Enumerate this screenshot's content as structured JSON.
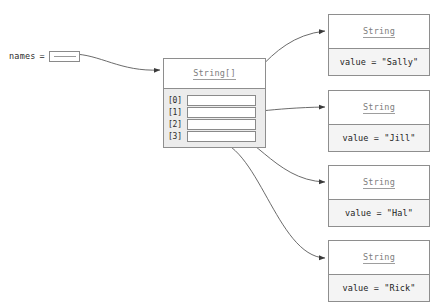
{
  "diagram": {
    "kind": "object-reference-diagram",
    "variable": {
      "name": "names",
      "assign": "=",
      "pointer_icon": "reference-pointer-icon"
    },
    "array_object": {
      "type_label": "String[]",
      "slots": [
        {
          "index_label": "[0]",
          "points_to": "String \"Sally\""
        },
        {
          "index_label": "[1]",
          "points_to": "String \"Jill\""
        },
        {
          "index_label": "[2]",
          "points_to": "String \"Hal\""
        },
        {
          "index_label": "[3]",
          "points_to": "String \"Rick\""
        }
      ]
    },
    "string_objects": [
      {
        "type_label": "String",
        "field": "value = \"Sally\""
      },
      {
        "type_label": "String",
        "field": "value = \"Jill\""
      },
      {
        "type_label": "String",
        "field": "value = \"Hal\""
      },
      {
        "type_label": "String",
        "field": "value = \"Rick\""
      }
    ],
    "colors": {
      "background": "#ffffff",
      "box_border": "#8e8e8e",
      "slot_fill": "#ececec",
      "body_fill": "#f4f4f4",
      "type_text": "#7d7d7d",
      "value_text": "#1c1c1c",
      "arrow": "#3a3a3a"
    }
  }
}
